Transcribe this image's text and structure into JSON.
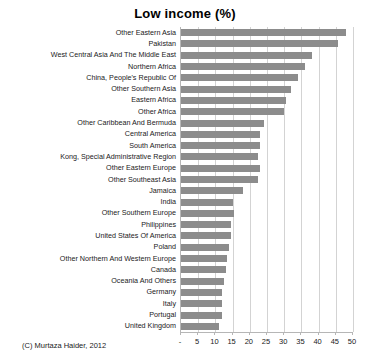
{
  "chart_data": {
    "type": "bar",
    "orientation": "horizontal",
    "title": "Low income (%)",
    "xlabel": "",
    "ylabel": "",
    "xlim": [
      0,
      50
    ],
    "grid": true,
    "legend": false,
    "bar_color": "#8c8c8c",
    "xticks": [
      "-",
      "5",
      "10",
      "15",
      "20",
      "25",
      "30",
      "35",
      "40",
      "45",
      "50"
    ],
    "xtick_values": [
      0,
      5,
      10,
      15,
      20,
      25,
      30,
      35,
      40,
      45,
      50
    ],
    "categories": [
      "Other Eastern Asia",
      "Pakistan",
      "West Central Asia And The Middle East",
      "Northern Africa",
      "China, People's Republic Of",
      "Other Southern Asia",
      "Eastern Africa",
      "Other Africa",
      "Other Caribbean And Bermuda",
      "Central America",
      "South America",
      "Kong, Special Administrative Region",
      "Other Eastern Europe",
      "Other Southeast Asia",
      "Jamaica",
      "India",
      "Other Southern Europe",
      "Philippines",
      "United States Of America",
      "Poland",
      "Other Northern And Western Europe",
      "Canada",
      "Oceania And Others",
      "Germany",
      "Italy",
      "Portugal",
      "United Kingdom"
    ],
    "values": [
      48.0,
      45.5,
      38.0,
      36.0,
      34.0,
      32.0,
      30.5,
      30.0,
      24.0,
      23.0,
      23.0,
      22.5,
      23.0,
      22.5,
      18.0,
      15.0,
      15.5,
      14.5,
      14.5,
      14.0,
      13.5,
      13.0,
      12.5,
      12.0,
      12.0,
      12.0,
      11.0
    ]
  },
  "credit": "(C) Murtaza Haider, 2012"
}
